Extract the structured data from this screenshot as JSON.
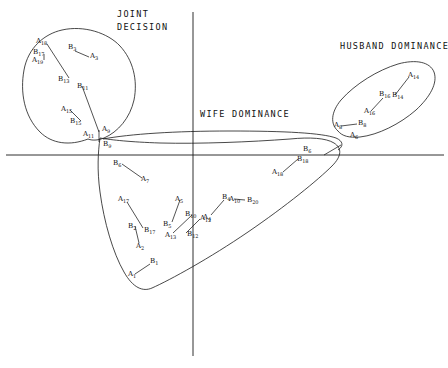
{
  "figure": {
    "width": 448,
    "height": 368,
    "background": "#ffffff",
    "ink": "#1a1a1a"
  },
  "chart_data": {
    "type": "scatter",
    "title": "",
    "xlabel": "",
    "ylabel": "",
    "xlim": [
      0,
      448
    ],
    "ylim": [
      0,
      368
    ],
    "grid": false,
    "legend": null,
    "axes": {
      "x_axis_y": 155,
      "x_axis_x0": 6,
      "x_axis_x1": 444,
      "y_axis_x": 193,
      "y_axis_y0": 12,
      "y_axis_y1": 356
    },
    "region_labels": [
      {
        "name": "joint-decision",
        "lines": [
          "JOINT",
          "DECISION"
        ],
        "x": 117,
        "y": 8
      },
      {
        "name": "husband-dominance",
        "lines": [
          "HUSBAND DOMINANCE"
        ],
        "x": 340,
        "y": 40
      },
      {
        "name": "wife-dominance",
        "lines": [
          "WIFE DOMINANCE"
        ],
        "x": 200,
        "y": 108
      }
    ],
    "clusters": [
      {
        "name": "joint-decision-cluster",
        "path": "M 88,139 C 70,146 52,144 40,132 C 24,116 20,92 24,70 C 28,48 44,34 62,30 C 84,25 108,33 120,46 C 133,60 138,80 134,100 C 130,118 118,132 104,138 C 99,140 93,141 88,139 Z"
      },
      {
        "name": "husband-dominance-cluster",
        "path": "M 338,131 C 330,124 331,112 341,100 C 355,84 378,70 398,64 C 416,59 430,62 434,72 C 438,83 430,97 416,110 C 400,124 378,135 360,137 C 349,138 342,136 338,131 Z"
      },
      {
        "name": "wife-dominance-cluster",
        "path": "M 100,138 C 98,152 97,170 100,192 C 104,222 113,253 124,272 C 133,288 143,292 152,288 C 170,280 210,258 248,232 C 286,206 318,180 332,166 C 342,156 342,148 334,143 C 326,138 310,137 290,139 C 250,142 200,144 160,143 C 130,142 112,140 100,138 Z"
      },
      {
        "name": "wife-dominance-tail",
        "path": "M 103,139 C 130,134 175,131 230,131 C 285,131 322,133 336,138 C 343,141 344,146 338,150"
      }
    ],
    "connectors": [
      {
        "name": "conn-a18-b13",
        "x1": 47,
        "y1": 44,
        "x2": 69,
        "y2": 78
      },
      {
        "name": "conn-b17-a19",
        "x1": 44,
        "y1": 54,
        "x2": 44,
        "y2": 60
      },
      {
        "name": "conn-b3-a3",
        "x1": 75,
        "y1": 51,
        "x2": 89,
        "y2": 57
      },
      {
        "name": "conn-b11-a11",
        "x1": 82,
        "y1": 86,
        "x2": 99,
        "y2": 132
      },
      {
        "name": "conn-a15-b15",
        "x1": 70,
        "y1": 110,
        "x2": 81,
        "y2": 121
      },
      {
        "name": "conn-a9-b9",
        "x1": 99,
        "y1": 130,
        "x2": 99,
        "y2": 142
      },
      {
        "name": "conn-b6-a7",
        "x1": 122,
        "y1": 164,
        "x2": 142,
        "y2": 178
      },
      {
        "name": "conn-a17-b17b",
        "x1": 127,
        "y1": 202,
        "x2": 143,
        "y2": 228
      },
      {
        "name": "conn-b2-a2",
        "x1": 135,
        "y1": 226,
        "x2": 139,
        "y2": 243
      },
      {
        "name": "conn-a5-b5",
        "x1": 180,
        "y1": 200,
        "x2": 172,
        "y2": 222
      },
      {
        "name": "conn-a13-b10",
        "x1": 173,
        "y1": 233,
        "x2": 192,
        "y2": 215
      },
      {
        "name": "conn-b12-a12",
        "x1": 186,
        "y1": 233,
        "x2": 200,
        "y2": 219
      },
      {
        "name": "conn-a1-b1",
        "x1": 135,
        "y1": 274,
        "x2": 150,
        "y2": 264
      },
      {
        "name": "conn-a4-b4",
        "x1": 211,
        "y1": 215,
        "x2": 224,
        "y2": 200
      },
      {
        "name": "conn-b20-a10",
        "x1": 245,
        "y1": 200,
        "x2": 234,
        "y2": 199
      },
      {
        "name": "conn-a18-b18",
        "x1": 283,
        "y1": 172,
        "x2": 298,
        "y2": 159
      },
      {
        "name": "conn-b6r-out",
        "x1": 324,
        "y1": 155,
        "x2": 341,
        "y2": 145
      },
      {
        "name": "conn-a8-b8",
        "x1": 341,
        "y1": 126,
        "x2": 357,
        "y2": 124
      },
      {
        "name": "conn-a16-b16",
        "x1": 371,
        "y1": 111,
        "x2": 383,
        "y2": 98
      },
      {
        "name": "conn-b14-a14",
        "x1": 395,
        "y1": 95,
        "x2": 409,
        "y2": 77
      }
    ],
    "points": [
      {
        "name": "point-A18",
        "letter": "A",
        "sub": "18",
        "x": 36,
        "y": 38
      },
      {
        "name": "point-B17",
        "letter": "B",
        "sub": "17",
        "x": 33,
        "y": 49
      },
      {
        "name": "point-A19",
        "letter": "A",
        "sub": "19",
        "x": 32,
        "y": 57
      },
      {
        "name": "point-B3",
        "letter": "B",
        "sub": "3",
        "x": 68,
        "y": 44
      },
      {
        "name": "point-A3",
        "letter": "A",
        "sub": "3",
        "x": 90,
        "y": 53
      },
      {
        "name": "point-B13",
        "letter": "B",
        "sub": "13",
        "x": 58,
        "y": 76
      },
      {
        "name": "point-B11",
        "letter": "B",
        "sub": "11",
        "x": 77,
        "y": 83
      },
      {
        "name": "point-A15",
        "letter": "A",
        "sub": "15",
        "x": 61,
        "y": 106
      },
      {
        "name": "point-B15",
        "letter": "B",
        "sub": "15",
        "x": 70,
        "y": 118
      },
      {
        "name": "point-A11",
        "letter": "A",
        "sub": "11",
        "x": 83,
        "y": 131
      },
      {
        "name": "point-A9",
        "letter": "A",
        "sub": "9",
        "x": 102,
        "y": 126
      },
      {
        "name": "point-B9",
        "letter": "B",
        "sub": "9",
        "x": 103,
        "y": 141
      },
      {
        "name": "point-B6",
        "letter": "B",
        "sub": "6",
        "x": 113,
        "y": 160
      },
      {
        "name": "point-A7",
        "letter": "A",
        "sub": "7",
        "x": 141,
        "y": 176
      },
      {
        "name": "point-A17",
        "letter": "A",
        "sub": "17",
        "x": 118,
        "y": 196
      },
      {
        "name": "point-B2",
        "letter": "B",
        "sub": "2",
        "x": 128,
        "y": 223
      },
      {
        "name": "point-B17b",
        "letter": "B",
        "sub": "17",
        "x": 144,
        "y": 227
      },
      {
        "name": "point-A2",
        "letter": "A",
        "sub": "2",
        "x": 136,
        "y": 243
      },
      {
        "name": "point-A5",
        "letter": "A",
        "sub": "5",
        "x": 175,
        "y": 196
      },
      {
        "name": "point-B5",
        "letter": "B",
        "sub": "5",
        "x": 163,
        "y": 221
      },
      {
        "name": "point-A13",
        "letter": "A",
        "sub": "13",
        "x": 165,
        "y": 232
      },
      {
        "name": "point-B10",
        "letter": "B",
        "sub": "10",
        "x": 185,
        "y": 211
      },
      {
        "name": "point-A12",
        "letter": "A",
        "sub": "12",
        "x": 200,
        "y": 215
      },
      {
        "name": "point-B12",
        "letter": "B",
        "sub": "12",
        "x": 187,
        "y": 231
      },
      {
        "name": "point-A1",
        "letter": "A",
        "sub": "1",
        "x": 128,
        "y": 271
      },
      {
        "name": "point-B1",
        "letter": "B",
        "sub": "1",
        "x": 150,
        "y": 258
      },
      {
        "name": "point-A4",
        "letter": "A",
        "sub": "4",
        "x": 203,
        "y": 214
      },
      {
        "name": "point-B4",
        "letter": "B",
        "sub": "4",
        "x": 222,
        "y": 194
      },
      {
        "name": "point-A10",
        "letter": "A",
        "sub": "10",
        "x": 229,
        "y": 196
      },
      {
        "name": "point-B20",
        "letter": "B",
        "sub": "20",
        "x": 247,
        "y": 197
      },
      {
        "name": "point-A18r",
        "letter": "A",
        "sub": "18",
        "x": 272,
        "y": 169
      },
      {
        "name": "point-B18",
        "letter": "B",
        "sub": "18",
        "x": 297,
        "y": 156
      },
      {
        "name": "point-B6r",
        "letter": "B",
        "sub": "6",
        "x": 303,
        "y": 146
      },
      {
        "name": "point-A8",
        "letter": "A",
        "sub": "8",
        "x": 334,
        "y": 122
      },
      {
        "name": "point-B8",
        "letter": "B",
        "sub": "8",
        "x": 358,
        "y": 120
      },
      {
        "name": "point-A6",
        "letter": "A",
        "sub": "6",
        "x": 350,
        "y": 132
      },
      {
        "name": "point-A16",
        "letter": "A",
        "sub": "16",
        "x": 364,
        "y": 108
      },
      {
        "name": "point-B16",
        "letter": "B",
        "sub": "16",
        "x": 379,
        "y": 91
      },
      {
        "name": "point-B14",
        "letter": "B",
        "sub": "14",
        "x": 392,
        "y": 92
      },
      {
        "name": "point-A14",
        "letter": "A",
        "sub": "14",
        "x": 408,
        "y": 72
      }
    ]
  }
}
